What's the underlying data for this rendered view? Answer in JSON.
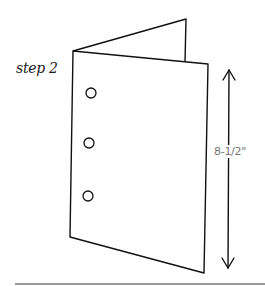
{
  "figure": {
    "step_label": "step 2",
    "dimension_label": "8-1/2\"",
    "hole_count": 3,
    "colors": {
      "line": "#111111",
      "dimension_text": "#777777",
      "rule": "#9a9a9a",
      "background": "#ffffff"
    }
  }
}
